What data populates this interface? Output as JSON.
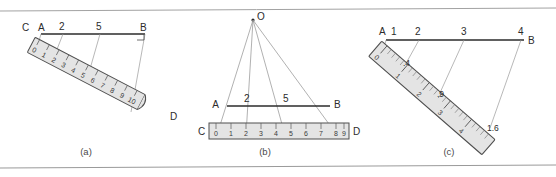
{
  "figure": {
    "background_color": "#ffffff",
    "ink_color": "#2b2b2b",
    "thin_line_color": "#8f8f8f",
    "ruler_fill": "#e2e2e2",
    "ruler_edge": "#5a5a5a",
    "border_color": "#9a9a9a"
  },
  "panels": [
    {
      "id": "a",
      "caption": "(a)",
      "description": "Slanted ruler from C to D used to divide segment AB",
      "segment": {
        "start_label": "A",
        "end_label": "B"
      },
      "ruler": {
        "start_label": "C",
        "end_label": "D",
        "numbers": [
          "0",
          "1",
          "2",
          "3",
          "4",
          "5",
          "6",
          "7",
          "8",
          "9",
          "10"
        ]
      },
      "projection_labels": [
        "2",
        "5"
      ],
      "right_angle_mark": true
    },
    {
      "id": "b",
      "caption": "(b)",
      "description": "Rays from point O projecting ruler divisions onto segment AB",
      "apex_label": "O",
      "segment": {
        "start_label": "A",
        "end_label": "B"
      },
      "ruler": {
        "start_label": "C",
        "end_label": "D",
        "numbers": [
          "0",
          "1",
          "2",
          "3",
          "4",
          "5",
          "6",
          "7",
          "8",
          "9"
        ]
      },
      "projection_labels": [
        "2",
        "5"
      ]
    },
    {
      "id": "c",
      "caption": "(c)",
      "description": "Slanted ruler with decimal subdivisions projecting onto segment AB",
      "segment": {
        "start_label": "A",
        "end_label": "B"
      },
      "ruler": {
        "numbers": [
          "0",
          "1",
          "2",
          "3",
          "4"
        ]
      },
      "top_labels": [
        "1",
        "2",
        "3",
        "4"
      ],
      "tick_value_labels": [
        ".4",
        ".9",
        "1.6"
      ]
    }
  ]
}
